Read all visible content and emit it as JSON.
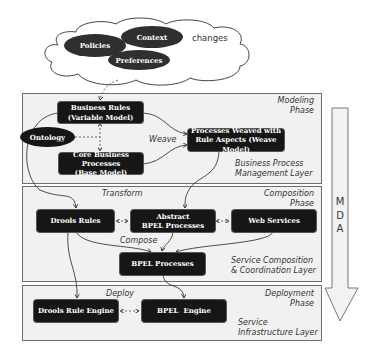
{
  "cloud": {
    "items": [
      {
        "label": "Policies"
      },
      {
        "label": "Context"
      },
      {
        "label": "Preferences"
      }
    ],
    "changes_label": "changes"
  },
  "layers": [
    {
      "phase_line1": "Modeling",
      "phase_line2": "Phase",
      "layer_line1": "Business Process",
      "layer_line2": "Management Layer",
      "nodes": {
        "business_rules_l1": "Business Rules",
        "business_rules_l2": "(Variable Model)",
        "ontology": "Ontology",
        "core_l1": "Core Business Processes",
        "core_l2": "(Base Model)",
        "weaved_l1": "Processes Weaved with",
        "weaved_l2": "Rule Aspects (Weave Model)"
      },
      "edge_label": "Weave"
    },
    {
      "phase_line1": "Composition",
      "phase_line2": "Phase",
      "layer_line1": "Service Composition",
      "layer_line2": "& Coordination Layer",
      "nodes": {
        "drools_rules": "Drools Rules",
        "abstract_l1": "Abstract",
        "abstract_l2": "BPEL Processes",
        "web_services": "Web Services",
        "bpel_processes": "BPEL Processes"
      },
      "edge_labels": {
        "transform": "Transform",
        "compose": "Compose"
      }
    },
    {
      "phase_line1": "Deployment",
      "phase_line2": "Phase",
      "layer_line1": "Service",
      "layer_line2": "Infrastructure Layer",
      "nodes": {
        "drools_engine": "Drools Rule Engine",
        "bpel_engine": "BPEL  Engine"
      },
      "edge_label": "Deploy"
    }
  ],
  "mda_arrow": {
    "letters": [
      "M",
      "D",
      "A"
    ]
  },
  "colors": {
    "node_fill": "#161616",
    "layer_fill": "#f1f1f1",
    "layer_border": "#6e6e6e",
    "ellipse_fill": "#2f2f2f"
  }
}
